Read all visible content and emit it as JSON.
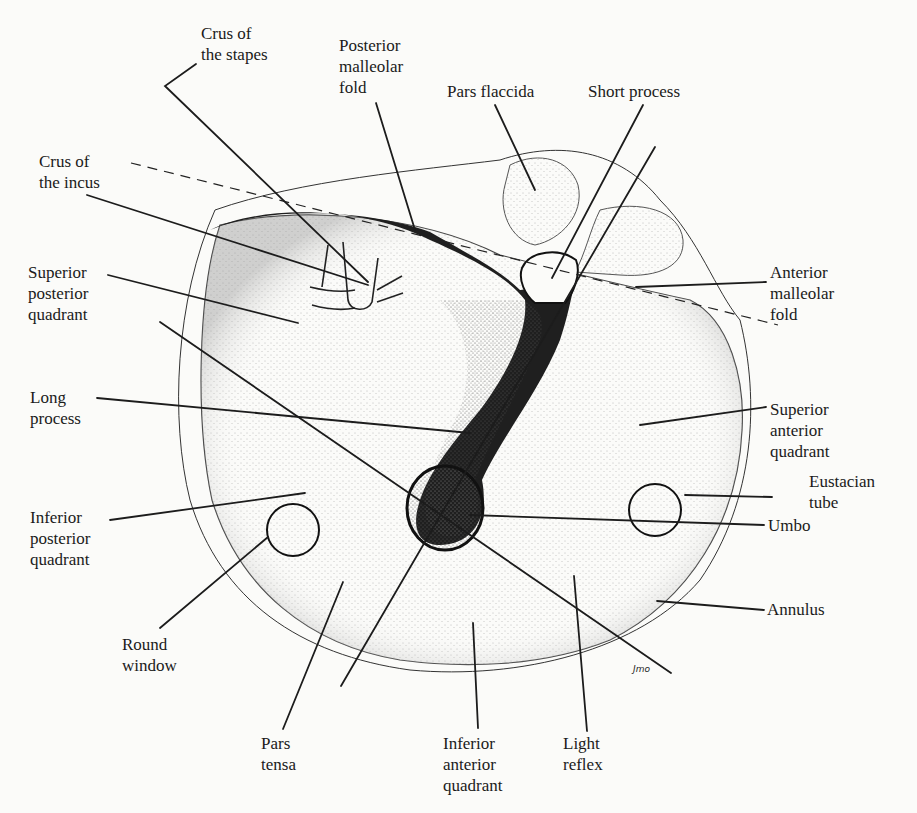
{
  "figure": {
    "signature": "Jmo"
  },
  "labels": {
    "crus_stapes": [
      "Crus of",
      "the stapes"
    ],
    "posterior_malleolar_fold": [
      "Posterior",
      "malleolar",
      "fold"
    ],
    "pars_flaccida": [
      "Pars flaccida"
    ],
    "short_process": [
      "Short process"
    ],
    "crus_incus": [
      "Crus of",
      "the incus"
    ],
    "superior_posterior_quadrant": [
      "Superior",
      "posterior",
      "quadrant"
    ],
    "anterior_malleolar_fold": [
      "Anterior",
      "malleolar",
      "fold"
    ],
    "long_process": [
      "Long",
      "process"
    ],
    "superior_anterior_quadrant": [
      "Superior",
      "anterior",
      "quadrant"
    ],
    "eustacian_tube": [
      "Eustacian",
      "tube"
    ],
    "umbo": [
      "Umbo"
    ],
    "inferior_posterior_quadrant": [
      "Inferior",
      "posterior",
      "quadrant"
    ],
    "annulus": [
      "Annulus"
    ],
    "round_window": [
      "Round",
      "window"
    ],
    "pars_tensa": [
      "Pars",
      "tensa"
    ],
    "inferior_anterior_quadrant": [
      "Inferior",
      "anterior",
      "quadrant"
    ],
    "light_reflex": [
      "Light",
      "reflex"
    ]
  },
  "colors": {
    "ink": "#1a1a1a",
    "paper": "#fbfbf9",
    "stipple": "#8a8a8a"
  }
}
